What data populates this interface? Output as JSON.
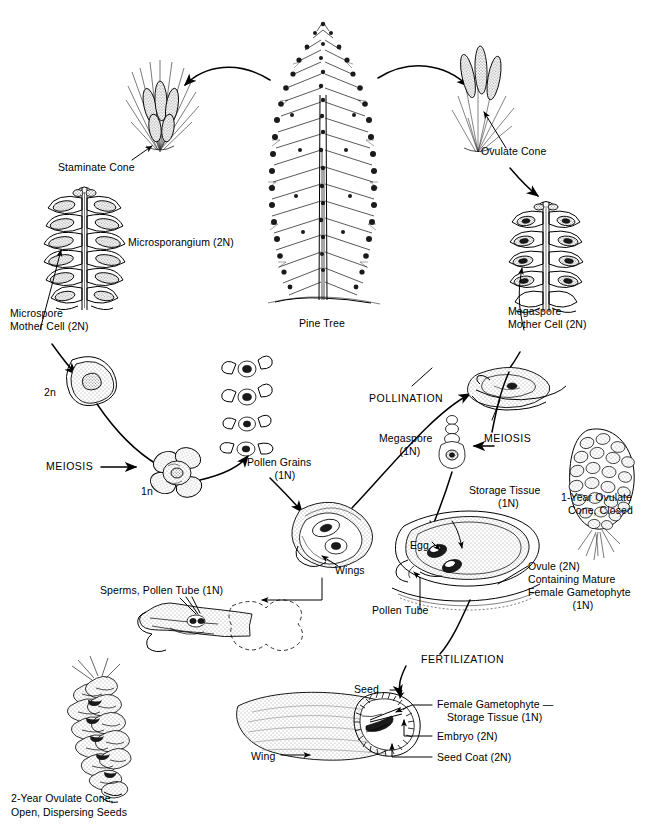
{
  "diagram": {
    "type": "biological-life-cycle-diagram",
    "style": "black-and-white line illustration"
  },
  "labels": {
    "staminate_cone": "Staminate Cone",
    "microsporangium": "Microsporangium (2N)",
    "microspore_mother_cell": "Microspore\nMother Cell (2N)",
    "two_n": "2n",
    "meiosis_left": "MEIOSIS",
    "one_n": "1n",
    "pollen_grains": "Pollen Grains\n(1N)",
    "pine_tree": "Pine Tree",
    "ovulate_cone": "Ovulate Cone",
    "megaspore_mother_cell": "Megaspore\nMother Cell (2N)",
    "pollination": "POLLINATION",
    "megaspore": "Megaspore\n(1N)",
    "meiosis_right": "MEIOSIS",
    "storage_tissue": "Storage Tissue\n(1N)",
    "one_year_cone": "1-Year Ovulate\nCone, Closed",
    "egg": "Egg",
    "ovule": "Ovule (2N)\nContaining Mature\nFemale Gametophyte\n(1N)",
    "pollen_tube": "Pollen Tube",
    "wings": "Wings",
    "sperms_pollen_tube": "Sperms, Pollen Tube (1N)",
    "fertilization": "FERTILIZATION",
    "seed": "Seed",
    "female_gametophyte": "Female Gametophyte —\nStorage Tissue (1N)",
    "embryo": "Embryo (2N)",
    "seed_coat": "Seed Coat (2N)",
    "wing": "Wing",
    "two_year_cone": "2-Year Ovulate Cone,\nOpen, Dispersing Seeds"
  },
  "label_lines": {
    "microspore_mother_cell_1": "Microspore",
    "microspore_mother_cell_2": "Mother Cell (2N)",
    "pollen_grains_1": "Pollen Grains",
    "pollen_grains_2": "(1N)",
    "megaspore_mother_cell_1": "Megaspore",
    "megaspore_mother_cell_2": "Mother Cell (2N)",
    "megaspore_1": "Megaspore",
    "megaspore_2": "(1N)",
    "storage_tissue_1": "Storage Tissue",
    "storage_tissue_2": "(1N)",
    "one_year_cone_1": "1-Year Ovulate",
    "one_year_cone_2": "Cone, Closed",
    "ovule_1": "Ovule (2N)",
    "ovule_2": "Containing Mature",
    "ovule_3": "Female Gametophyte",
    "ovule_4": "(1N)",
    "female_gametophyte_1": "Female Gametophyte —",
    "female_gametophyte_2": "Storage Tissue (1N)",
    "two_year_cone_1": "2-Year Ovulate Cone,",
    "two_year_cone_2": "Open, Dispersing Seeds"
  },
  "colors": {
    "ink": "#000000",
    "background": "#ffffff",
    "stipple": "#9a9a9a"
  }
}
